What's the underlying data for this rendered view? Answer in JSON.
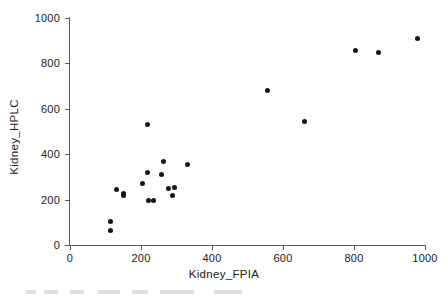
{
  "chart_data": {
    "type": "scatter",
    "title": "",
    "xlabel": "Kidney_FPIA",
    "ylabel": "Kidney_HPLC",
    "xlim": [
      0,
      1000
    ],
    "ylim": [
      0,
      1000
    ],
    "xticks": [
      0,
      200,
      400,
      600,
      800,
      1000
    ],
    "yticks": [
      0,
      200,
      400,
      600,
      800,
      1000
    ],
    "xtick_labels": [
      "0",
      "200",
      "400",
      "600",
      "800",
      "1000"
    ],
    "ytick_labels": [
      "0",
      "200",
      "400",
      "600",
      "800",
      "1000"
    ],
    "grid": false,
    "legend": null,
    "marker": "filled-circle",
    "marker_color": "#141414",
    "axis_color": "#5a5a5a",
    "background_color": "#ffffff",
    "points": [
      {
        "x": 115,
        "y": 103
      },
      {
        "x": 115,
        "y": 62
      },
      {
        "x": 132,
        "y": 244
      },
      {
        "x": 150,
        "y": 229
      },
      {
        "x": 152,
        "y": 220
      },
      {
        "x": 203,
        "y": 271
      },
      {
        "x": 217,
        "y": 530
      },
      {
        "x": 217,
        "y": 321
      },
      {
        "x": 234,
        "y": 194
      },
      {
        "x": 220,
        "y": 196
      },
      {
        "x": 262,
        "y": 366
      },
      {
        "x": 258,
        "y": 310
      },
      {
        "x": 278,
        "y": 247
      },
      {
        "x": 289,
        "y": 218
      },
      {
        "x": 293,
        "y": 252
      },
      {
        "x": 330,
        "y": 355
      },
      {
        "x": 555,
        "y": 679
      },
      {
        "x": 660,
        "y": 546
      },
      {
        "x": 803,
        "y": 855
      },
      {
        "x": 869,
        "y": 848
      },
      {
        "x": 980,
        "y": 911
      }
    ]
  }
}
